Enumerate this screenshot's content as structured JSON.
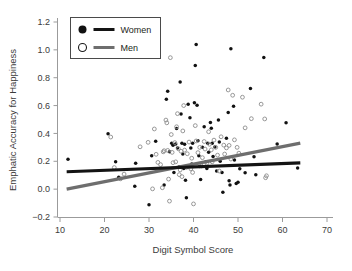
{
  "chart_data": {
    "type": "scatter",
    "title": "",
    "xlabel": "Digit Symbol Score",
    "ylabel": "Emphatic Accuracy for Happiness",
    "xlim": [
      8,
      72
    ],
    "ylim": [
      -0.28,
      1.28
    ],
    "xticks": [
      10,
      20,
      30,
      40,
      50,
      60,
      70
    ],
    "yticks": [
      -0.2,
      0.0,
      0.2,
      0.4,
      0.6,
      0.8,
      1.0,
      1.2
    ],
    "xtick_labels": [
      "10",
      "20",
      "30",
      "40",
      "50",
      "60",
      "70"
    ],
    "ytick_labels": [
      "-0.2",
      "0.0",
      "0.2",
      "0.4",
      "0.6",
      "0.8",
      "1.0",
      "1.2"
    ],
    "grid": false,
    "legend_position": "top-left",
    "legend": [
      {
        "name": "Women",
        "marker": "filled-circle",
        "color": "#111111",
        "line_color": "#141414"
      },
      {
        "name": "Men",
        "marker": "open-circle",
        "color": "#8c8c8c",
        "line_color": "#6e6e6e"
      }
    ],
    "series": [
      {
        "name": "Women",
        "marker": "filled-circle",
        "color": "#111111",
        "points": [
          [
            11.8,
            0.215
          ],
          [
            20.8,
            0.398
          ],
          [
            22.5,
            0.196
          ],
          [
            23.2,
            0.085
          ],
          [
            26.8,
            0.02
          ],
          [
            27.0,
            0.186
          ],
          [
            30.0,
            -0.112
          ],
          [
            30.6,
            0.24
          ],
          [
            31.5,
            0.343
          ],
          [
            33.4,
            0.03
          ],
          [
            33.6,
            0.146
          ],
          [
            33.9,
            0.645
          ],
          [
            34.2,
            0.703
          ],
          [
            34.6,
            0.268
          ],
          [
            35.1,
            0.33
          ],
          [
            35.4,
            0.316
          ],
          [
            35.6,
            0.12
          ],
          [
            36.0,
            0.325
          ],
          [
            36.2,
            0.435
          ],
          [
            36.4,
            0.296
          ],
          [
            36.8,
            0.16
          ],
          [
            37.0,
            0.77
          ],
          [
            37.2,
            0.54
          ],
          [
            37.4,
            0.33
          ],
          [
            37.6,
            0.252
          ],
          [
            37.8,
            0.148
          ],
          [
            38.0,
            0.322
          ],
          [
            38.2,
            0.064
          ],
          [
            38.4,
            -0.062
          ],
          [
            38.8,
            0.61
          ],
          [
            39.2,
            0.512
          ],
          [
            39.4,
            0.295
          ],
          [
            39.6,
            0.18
          ],
          [
            39.8,
            0.33
          ],
          [
            40.2,
            0.62
          ],
          [
            40.4,
            0.888
          ],
          [
            40.6,
            1.038
          ],
          [
            40.8,
            0.602
          ],
          [
            41.0,
            0.348
          ],
          [
            41.2,
            0.24
          ],
          [
            41.4,
            0.162
          ],
          [
            41.6,
            0.07
          ],
          [
            42.0,
            0.3
          ],
          [
            42.4,
            0.448
          ],
          [
            42.8,
            0.196
          ],
          [
            43.0,
            0.148
          ],
          [
            43.2,
            0.33
          ],
          [
            43.4,
            0.264
          ],
          [
            43.8,
            0.478
          ],
          [
            44.0,
            0.438
          ],
          [
            44.2,
            0.33
          ],
          [
            44.4,
            0.234
          ],
          [
            44.8,
            0.302
          ],
          [
            45.2,
            0.13
          ],
          [
            45.6,
            0.496
          ],
          [
            45.8,
            0.338
          ],
          [
            46.0,
            0.2
          ],
          [
            46.4,
            0.12
          ],
          [
            46.6,
            -0.022
          ],
          [
            47.4,
            0.366
          ],
          [
            47.8,
            0.55
          ],
          [
            48.0,
            0.06
          ],
          [
            48.2,
            0.03
          ],
          [
            48.4,
            1.008
          ],
          [
            49.0,
            0.596
          ],
          [
            49.2,
            0.21
          ],
          [
            49.6,
            0.04
          ],
          [
            50.0,
            0.05
          ],
          [
            50.4,
            0.146
          ],
          [
            51.6,
            0.118
          ],
          [
            52.8,
            0.722
          ],
          [
            53.6,
            0.232
          ],
          [
            54.0,
            0.104
          ],
          [
            55.8,
            0.946
          ],
          [
            58.8,
            0.324
          ],
          [
            60.8,
            0.476
          ],
          [
            63.4,
            0.152
          ]
        ]
      },
      {
        "name": "Men",
        "marker": "open-circle",
        "color": "#8c8c8c",
        "points": [
          [
            21.4,
            0.374
          ],
          [
            22.2,
            0.155
          ],
          [
            23.6,
            0.074
          ],
          [
            24.4,
            0.108
          ],
          [
            28.0,
            0.304
          ],
          [
            29.8,
            0.336
          ],
          [
            30.8,
            0.002
          ],
          [
            31.2,
            0.432
          ],
          [
            31.6,
            0.25
          ],
          [
            32.0,
            0.192
          ],
          [
            32.6,
            0.176
          ],
          [
            33.0,
            0.01
          ],
          [
            33.2,
            0.268
          ],
          [
            33.4,
            0.276
          ],
          [
            33.8,
            0.496
          ],
          [
            34.0,
            0.476
          ],
          [
            34.2,
            0.278
          ],
          [
            34.4,
            0.072
          ],
          [
            34.6,
            -0.086
          ],
          [
            34.8,
            0.944
          ],
          [
            35.0,
            0.392
          ],
          [
            35.2,
            0.264
          ],
          [
            35.4,
            0.19
          ],
          [
            35.8,
            0.334
          ],
          [
            36.0,
            0.196
          ],
          [
            36.2,
            0.448
          ],
          [
            36.4,
            0.542
          ],
          [
            36.6,
            0.29
          ],
          [
            36.8,
            0.104
          ],
          [
            37.0,
            0.138
          ],
          [
            37.2,
            0.272
          ],
          [
            37.4,
            0.09
          ],
          [
            37.6,
            0.418
          ],
          [
            37.8,
            0.6
          ],
          [
            38.0,
            0.28
          ],
          [
            38.4,
            0.156
          ],
          [
            38.6,
            0.254
          ],
          [
            39.0,
            0.338
          ],
          [
            39.4,
            0.146
          ],
          [
            39.6,
            0.222
          ],
          [
            39.8,
            0.12
          ],
          [
            40.0,
            -0.106
          ],
          [
            40.4,
            0.456
          ],
          [
            40.6,
            0.346
          ],
          [
            41.0,
            0.262
          ],
          [
            41.4,
            0.3
          ],
          [
            41.8,
            0.166
          ],
          [
            42.0,
            0.226
          ],
          [
            42.4,
            0.342
          ],
          [
            42.6,
            0.288
          ],
          [
            43.0,
            0.186
          ],
          [
            43.4,
            0.412
          ],
          [
            43.6,
            0.322
          ],
          [
            44.0,
            0.282
          ],
          [
            44.2,
            0.196
          ],
          [
            44.6,
            0.352
          ],
          [
            45.0,
            0.3
          ],
          [
            45.4,
            0.244
          ],
          [
            45.8,
            0.13
          ],
          [
            46.2,
            0.376
          ],
          [
            46.8,
            0.316
          ],
          [
            47.0,
            0.252
          ],
          [
            47.4,
            0.296
          ],
          [
            47.8,
            0.712
          ],
          [
            48.0,
            0.314
          ],
          [
            48.4,
            0.216
          ],
          [
            48.8,
            0.674
          ],
          [
            49.2,
            0.354
          ],
          [
            49.8,
            0.3
          ],
          [
            50.2,
            0.258
          ],
          [
            51.0,
            0.66
          ],
          [
            51.6,
            0.44
          ],
          [
            53.0,
            0.506
          ],
          [
            55.2,
            0.61
          ],
          [
            56.0,
            0.504
          ],
          [
            56.2,
            0.082
          ],
          [
            56.4,
            0.096
          ]
        ]
      }
    ],
    "trend_lines": [
      {
        "name": "Women",
        "color": "#141414",
        "x0": 11.5,
        "y0": 0.125,
        "x1": 64.0,
        "y1": 0.188,
        "width": 3.2
      },
      {
        "name": "Men",
        "color": "#6e6e6e",
        "x0": 11.5,
        "y0": 0.0,
        "x1": 64.0,
        "y1": 0.33,
        "width": 3.2
      }
    ]
  }
}
